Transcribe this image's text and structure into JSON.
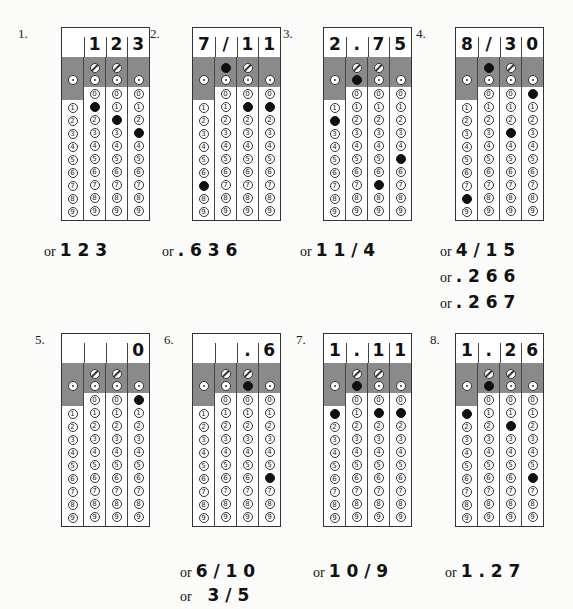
{
  "grids": [
    {
      "label": "1.",
      "header": [
        "",
        "1",
        "2",
        "3"
      ],
      "slash": [
        false,
        false
      ],
      "dot": [
        false,
        false,
        false,
        false
      ],
      "digits": [
        null,
        1,
        2,
        3
      ],
      "answers": [
        "1 2 3"
      ]
    },
    {
      "label": "2.",
      "header": [
        "7",
        "/",
        "1",
        "1"
      ],
      "slash": [
        true,
        false
      ],
      "dot": [
        false,
        false,
        false,
        false
      ],
      "digits": [
        7,
        null,
        1,
        1
      ],
      "answers": [
        ". 6 3 6"
      ]
    },
    {
      "label": "3.",
      "header": [
        "2",
        ".",
        "7",
        "5"
      ],
      "slash": [
        false,
        false
      ],
      "dot": [
        false,
        true,
        false,
        false
      ],
      "digits": [
        2,
        null,
        7,
        5
      ],
      "answers": [
        "1 1 / 4"
      ]
    },
    {
      "label": "4.",
      "header": [
        "8",
        "/",
        "3",
        "0"
      ],
      "slash": [
        true,
        false
      ],
      "dot": [
        false,
        false,
        false,
        false
      ],
      "digits": [
        8,
        null,
        3,
        0
      ],
      "answers": [
        "4 / 1 5",
        ". 2 6 6",
        ". 2 6 7"
      ]
    },
    {
      "label": "5.",
      "header": [
        "",
        "",
        "",
        "0"
      ],
      "slash": [
        false,
        false
      ],
      "dot": [
        false,
        false,
        false,
        false
      ],
      "digits": [
        null,
        null,
        null,
        0
      ],
      "answers": []
    },
    {
      "label": "6.",
      "header": [
        "",
        "",
        ".",
        "6"
      ],
      "slash": [
        false,
        false
      ],
      "dot": [
        false,
        false,
        true,
        false
      ],
      "digits": [
        null,
        null,
        null,
        6
      ],
      "answers": [
        "6 / 1 0",
        "  3 / 5"
      ]
    },
    {
      "label": "7.",
      "header": [
        "1",
        ".",
        "1",
        "1"
      ],
      "slash": [
        false,
        false
      ],
      "dot": [
        false,
        true,
        false,
        false
      ],
      "digits": [
        1,
        null,
        1,
        1
      ],
      "answers": [
        "1 0 / 9"
      ]
    },
    {
      "label": "8.",
      "header": [
        "1",
        ".",
        "2",
        "6"
      ],
      "slash": [
        false,
        false
      ],
      "dot": [
        false,
        true,
        false,
        false
      ],
      "digits": [
        1,
        null,
        2,
        6
      ],
      "answers": [
        "1 . 2 7"
      ]
    }
  ],
  "or_label": "or",
  "bubble_digits": [
    "0",
    "1",
    "2",
    "3",
    "4",
    "5",
    "6",
    "7",
    "8",
    "9"
  ],
  "colors": {
    "shade": "#8a8a8a",
    "filled": "#111111",
    "border": "#333333"
  }
}
